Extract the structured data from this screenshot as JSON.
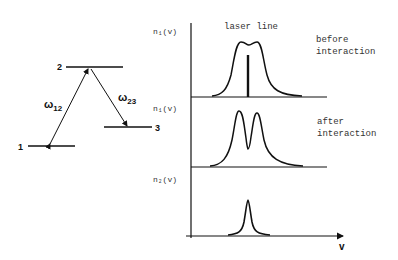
{
  "energy_levels": {
    "levels": [
      {
        "label": "1"
      },
      {
        "label": "2"
      },
      {
        "label": "3"
      }
    ],
    "transitions": [
      {
        "label_main": "ω",
        "label_sub": "12"
      },
      {
        "label_main": "ω",
        "label_sub": "23"
      }
    ]
  },
  "spectra": {
    "laser_label": "laser line",
    "x_axis_label": "v",
    "panels": [
      {
        "ylabel": "n₁(v)",
        "note_line1": "before",
        "note_line2": "interaction"
      },
      {
        "ylabel": "n₁(v)",
        "note_line1": "after",
        "note_line2": "interaction"
      },
      {
        "ylabel": "n₂(v)",
        "note_line1": "",
        "note_line2": ""
      }
    ]
  },
  "colors": {
    "ink": "#111111",
    "background": "#ffffff"
  }
}
